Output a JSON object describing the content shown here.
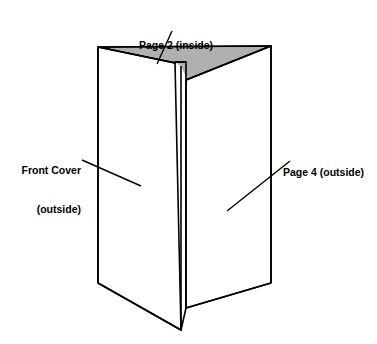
{
  "figure": {
    "type": "line-drawing",
    "background_color": "#ffffff",
    "stroke_color": "#000000",
    "panel_fill_color": "#ffffff",
    "inside_fill_color": "#b0b0b0",
    "stroke_width": 1.6,
    "labels": [
      {
        "id": "page2",
        "lines": [
          "Page 2 (inside)"
        ],
        "text": "Page 2 (inside)",
        "align": "center",
        "leader": {
          "from": [
            172,
            31
          ],
          "to": [
            157,
            64
          ]
        }
      },
      {
        "id": "front-cover",
        "lines": [
          "Front Cover",
          "(outside)"
        ],
        "text": "Front Cover (outside)",
        "align": "right",
        "leader": {
          "from": [
            82,
            160
          ],
          "to": [
            141,
            186
          ]
        }
      },
      {
        "id": "page4",
        "lines": [
          "Page 4 (outside)"
        ],
        "text": "Page 4 (outside)",
        "align": "left",
        "leader": {
          "from": [
            290,
            161
          ],
          "to": [
            227,
            211
          ]
        }
      }
    ],
    "geometry": {
      "left_panel_top_outer": [
        98,
        47
      ],
      "left_panel_bottom_outer": [
        98,
        283
      ],
      "right_panel_top_outer": [
        271,
        46
      ],
      "right_panel_bottom_outer": [
        271,
        283
      ],
      "front_fold_top": [
        181,
        66
      ],
      "front_fold_bottom": [
        181,
        330
      ],
      "notch_corner": [
        175,
        62
      ]
    }
  }
}
